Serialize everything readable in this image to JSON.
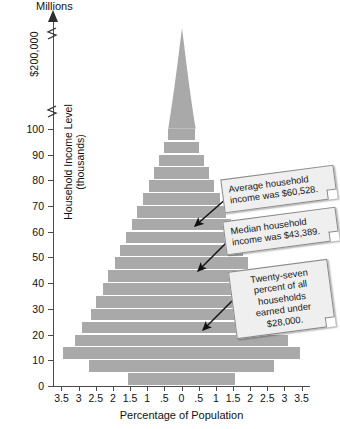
{
  "chart_data": {
    "type": "bar",
    "orientation": "horizontal-pyramid",
    "title": "",
    "xlabel": "Percentage of Population",
    "ylabel": "Household Income Level (thousands)",
    "top_axis_label": "Millions",
    "axis_break_label": "$200,000",
    "xticks": [
      "3.5",
      "3",
      "2.5",
      "2",
      "1.5",
      "1",
      ".5",
      "0",
      ".5",
      "1",
      "1.5",
      "2",
      "2.5",
      "3",
      "3.5"
    ],
    "xtick_values": [
      -3.5,
      -3,
      -2.5,
      -2,
      -1.5,
      -1,
      -0.5,
      0,
      0.5,
      1,
      1.5,
      2,
      2.5,
      3,
      3.5
    ],
    "yticks": [
      "100",
      "90",
      "80",
      "70",
      "60",
      "50",
      "40",
      "30",
      "20",
      "10",
      "0"
    ],
    "ytick_values": [
      100,
      90,
      80,
      70,
      60,
      50,
      40,
      30,
      20,
      10,
      0
    ],
    "xlim": [
      -3.5,
      3.5
    ],
    "ylim": [
      0,
      105
    ],
    "grid": false,
    "legend": "none",
    "bar_color": "#a9a9a9",
    "categories": [
      2.5,
      7.5,
      12.5,
      17.5,
      22.5,
      27.5,
      32.5,
      37.5,
      42.5,
      47.5,
      52.5,
      57.5,
      62.5,
      67.5,
      72.5,
      77.5,
      82.5,
      87.5,
      92.5,
      97.5
    ],
    "values": [
      1.55,
      2.7,
      3.45,
      3.1,
      2.9,
      2.65,
      2.5,
      2.3,
      2.15,
      1.95,
      1.8,
      1.62,
      1.45,
      1.3,
      1.12,
      0.95,
      0.8,
      0.66,
      0.52,
      0.4
    ],
    "note": "Each row is mirrored left and right of zero; value is the half-width percentage on each side."
  },
  "callouts": [
    {
      "id": "average-income",
      "line1": "Average household",
      "line2": "income was $60,528."
    },
    {
      "id": "median-income",
      "line1": "Median household",
      "line2": "income was $43,389."
    },
    {
      "id": "under-28000",
      "line1": "Twenty-seven",
      "line2": "percent of all",
      "line3": "households",
      "line4": "earned under",
      "line5": "$28,000."
    }
  ]
}
